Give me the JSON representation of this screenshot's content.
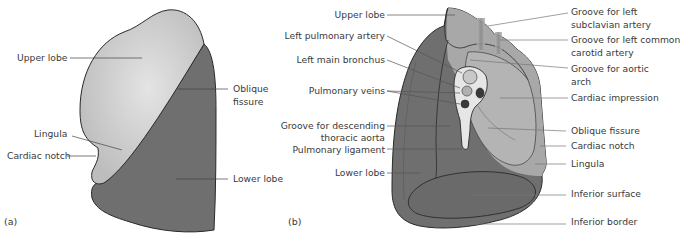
{
  "colors": {
    "upper_lobe": "#c4c4c4",
    "upper_lobe_highlight": "#e2e2e2",
    "lower_lobe": "#6f6f6f",
    "mediastinal_light": "#a8a8a8",
    "hilum_fill": "#e6e6e6",
    "outline": "#2a2a2a",
    "leader_line": "#555555",
    "text": "#3a3a3a"
  },
  "panel_a": {
    "tag": "(a)",
    "labels": {
      "upper_lobe": "Upper lobe",
      "lingula": "Lingula",
      "cardiac_notch": "Cardiac notch",
      "oblique_fissure_1": "Oblique",
      "oblique_fissure_2": "fissure",
      "lower_lobe": "Lower lobe"
    }
  },
  "panel_b": {
    "tag": "(b)",
    "left_labels": {
      "upper_lobe": "Upper lobe",
      "left_pulmonary_artery": "Left pulmonary artery",
      "left_main_bronchus": "Left main bronchus",
      "pulmonary_veins": "Pulmonary veins",
      "groove_descending_1": "Groove for descending",
      "groove_descending_2": "thoracic aorta",
      "pulmonary_ligament": "Pulmonary ligament",
      "lower_lobe": "Lower lobe"
    },
    "right_labels": {
      "groove_subclavian_1": "Groove for left",
      "groove_subclavian_2": "subclavian artery",
      "groove_carotid_1": "Groove for left common",
      "groove_carotid_2": "carotid artery",
      "groove_aortic_1": "Groove for aortic",
      "groove_aortic_2": "arch",
      "cardiac_impression": "Cardiac impression",
      "oblique_fissure": "Oblique fissure",
      "cardiac_notch": "Cardiac notch",
      "lingula": "Lingula",
      "inferior_surface": "Inferior surface",
      "inferior_border": "Inferior border"
    }
  }
}
